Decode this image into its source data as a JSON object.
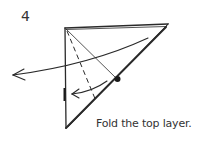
{
  "step": {
    "number": "4"
  },
  "caption": {
    "text": "Fold the top layer."
  },
  "diagram": {
    "elements": [
      "paper-outline",
      "valley-fold-line",
      "crease-line",
      "reference-dot",
      "large-turn-over-arrow",
      "small-fold-arrow",
      "layer-edge-mark"
    ],
    "colors": {
      "line": "#2a2a2a",
      "background": "#ffffff"
    }
  }
}
